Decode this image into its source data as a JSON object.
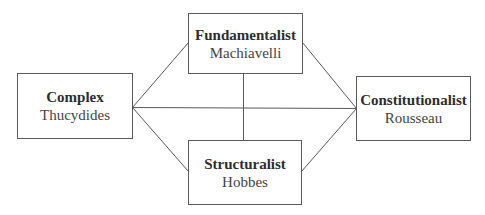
{
  "diagram": {
    "type": "network",
    "nodes": [
      {
        "id": "complex",
        "title": "Complex",
        "subtitle": "Thucydides"
      },
      {
        "id": "fundamentalist",
        "title": "Fundamentalist",
        "subtitle": "Machiavelli"
      },
      {
        "id": "structuralist",
        "title": "Structuralist",
        "subtitle": "Hobbes"
      },
      {
        "id": "constitutionalist",
        "title": "Constitutionalist",
        "subtitle": "Rousseau"
      }
    ],
    "edges": [
      {
        "from": "complex",
        "to": "fundamentalist"
      },
      {
        "from": "complex",
        "to": "structuralist"
      },
      {
        "from": "complex",
        "to": "constitutionalist"
      },
      {
        "from": "fundamentalist",
        "to": "constitutionalist"
      },
      {
        "from": "structuralist",
        "to": "constitutionalist"
      },
      {
        "from": "fundamentalist",
        "to": "structuralist"
      }
    ]
  },
  "colors": {
    "stroke": "#5a5a5a",
    "title_text": "#2e2e2e",
    "subtitle_text": "#444444",
    "background": "#ffffff"
  }
}
